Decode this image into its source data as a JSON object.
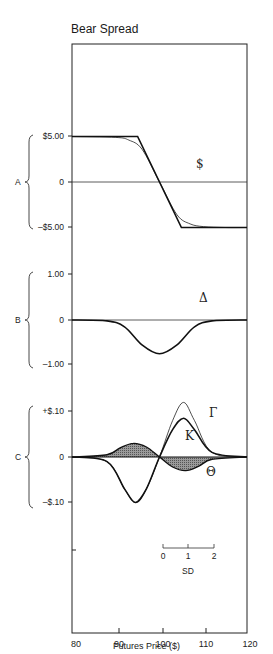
{
  "title": "Bear Spread",
  "xaxis": {
    "label": "Futures Price ($)",
    "ticks": [
      "80",
      "90",
      "100",
      "110",
      "120"
    ],
    "range": [
      80,
      120
    ]
  },
  "panels": [
    {
      "id": "A",
      "letter": "A",
      "ticks": [
        "$5.00",
        "0",
        "–$5.00"
      ],
      "glyph": "$"
    },
    {
      "id": "B",
      "letter": "B",
      "ticks": [
        "1.00",
        "0",
        "–1.00"
      ],
      "glyph": "Δ"
    },
    {
      "id": "C",
      "letter": "C",
      "ticks": [
        "+$.10",
        "0",
        "–$.10"
      ],
      "glyphs": {
        "gamma": "Γ",
        "kappa": "K",
        "theta": "Θ"
      }
    }
  ],
  "sd_scale": {
    "label": "SD",
    "ticks": [
      "0",
      "1",
      "2"
    ]
  },
  "chart_data": [
    {
      "type": "line",
      "panel": "A",
      "title": "Bear Spread",
      "ylabel": "$",
      "xlabel": "Futures Price ($)",
      "ylim": [
        -5,
        5
      ],
      "series": [
        {
          "name": "Expiration payoff",
          "x": [
            80,
            95,
            105,
            120
          ],
          "values": [
            5,
            5,
            -5,
            -5
          ]
        },
        {
          "name": "Current value",
          "x": [
            80,
            90,
            93,
            96,
            100,
            104,
            107,
            110,
            115,
            120
          ],
          "values": [
            5,
            4.9,
            4.6,
            3.6,
            0,
            -3.6,
            -4.6,
            -4.9,
            -5,
            -5
          ]
        }
      ]
    },
    {
      "type": "line",
      "panel": "B",
      "ylabel": "Δ",
      "ylim": [
        -1,
        1
      ],
      "series": [
        {
          "name": "Delta",
          "x": [
            80,
            88,
            92,
            96,
            100,
            104,
            108,
            112,
            120
          ],
          "values": [
            0,
            -0.02,
            -0.15,
            -0.55,
            -0.75,
            -0.55,
            -0.15,
            -0.02,
            0
          ]
        }
      ]
    },
    {
      "type": "line",
      "panel": "C",
      "ylim": [
        -0.1,
        0.1
      ],
      "series": [
        {
          "name": "Gamma (Γ)",
          "x": [
            80,
            88,
            92,
            94.5,
            97,
            100,
            103,
            105.5,
            108,
            112,
            120
          ],
          "values": [
            0,
            -0.01,
            -0.07,
            -0.1,
            -0.07,
            0,
            0.08,
            0.12,
            0.08,
            0.01,
            0
          ]
        },
        {
          "name": "Vega (K)",
          "x": [
            80,
            88,
            92,
            94.5,
            97,
            100,
            103,
            105.5,
            108,
            112,
            120
          ],
          "values": [
            0,
            -0.01,
            -0.07,
            -0.1,
            -0.07,
            0,
            0.06,
            0.085,
            0.06,
            0.01,
            0
          ]
        },
        {
          "name": "Theta (Θ)",
          "x": [
            80,
            88,
            91,
            94,
            97,
            100,
            103,
            106,
            109,
            112,
            120
          ],
          "values": [
            0,
            0.005,
            0.02,
            0.03,
            0.022,
            0,
            -0.022,
            -0.03,
            -0.02,
            -0.005,
            0
          ]
        }
      ]
    }
  ]
}
